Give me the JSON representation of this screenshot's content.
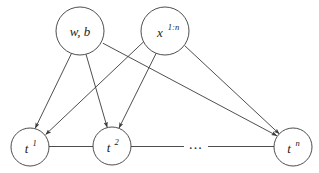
{
  "diagram": {
    "type": "directed-graphical-model",
    "background_color": "#ffffff",
    "stroke_color": "#3a3a3a",
    "text_color": "#1c1c1c",
    "nodes": [
      {
        "id": "wb",
        "label_base": "w, b",
        "label_sup": "",
        "cx": 80,
        "cy": 31,
        "r": 24,
        "role": "parameter-node"
      },
      {
        "id": "x",
        "label_base": "x",
        "label_sup": "1:n",
        "cx": 165,
        "cy": 31,
        "r": 24,
        "role": "observed-input-node"
      },
      {
        "id": "t1",
        "label_base": "t",
        "label_sup": "1",
        "cx": 30,
        "cy": 147,
        "r": 19,
        "role": "target-node"
      },
      {
        "id": "t2",
        "label_base": "t",
        "label_sup": "2",
        "cx": 112,
        "cy": 146,
        "r": 19,
        "role": "target-node"
      },
      {
        "id": "tn",
        "label_base": "t",
        "label_sup": "n",
        "cx": 293,
        "cy": 147,
        "r": 19,
        "role": "target-node"
      }
    ],
    "edges": [
      {
        "id": "wb-t1",
        "from": "wb",
        "to": "t1",
        "arrow": true
      },
      {
        "id": "wb-t2",
        "from": "wb",
        "to": "t2",
        "arrow": true
      },
      {
        "id": "wb-tn",
        "from": "wb",
        "to": "tn",
        "arrow": true
      },
      {
        "id": "x-t1",
        "from": "x",
        "to": "t1",
        "arrow": true
      },
      {
        "id": "x-t2",
        "from": "x",
        "to": "t2",
        "arrow": true
      },
      {
        "id": "x-tn",
        "from": "x",
        "to": "tn",
        "arrow": true
      }
    ],
    "chain_links": [
      {
        "id": "t1-t2",
        "x1": 49,
        "y1": 146.5,
        "x2": 93,
        "y2": 146.5
      },
      {
        "id": "t2-dots",
        "x1": 131,
        "y1": 146.5,
        "x2": 184,
        "y2": 146.5
      },
      {
        "id": "dots-tn",
        "x1": 208,
        "y1": 146.5,
        "x2": 274,
        "y2": 146.5
      }
    ],
    "ellipsis": {
      "text": "· · ·",
      "display": "...",
      "cx": 196,
      "cy": 144
    }
  }
}
